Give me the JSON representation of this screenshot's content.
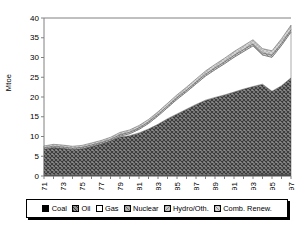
{
  "chart_data": {
    "type": "area",
    "title": "",
    "subtitle": "",
    "xlabel": "",
    "ylabel": "Mtoe",
    "ylim": [
      0,
      40
    ],
    "yticks": [
      0,
      5,
      10,
      15,
      20,
      25,
      30,
      35,
      40
    ],
    "grid": false,
    "legend_position": "bottom",
    "stacked": true,
    "x": [
      1971,
      1972,
      1973,
      1974,
      1975,
      1976,
      1977,
      1978,
      1979,
      1980,
      1981,
      1982,
      1983,
      1984,
      1985,
      1986,
      1987,
      1988,
      1989,
      1990,
      1991,
      1992,
      1993,
      1994,
      1995,
      1996,
      1997
    ],
    "xtick_labels": [
      "1971",
      "1973",
      "1975",
      "1977",
      "1979",
      "1981",
      "1983",
      "1985",
      "1987",
      "1989",
      "1991",
      "1993",
      "1995",
      "1997"
    ],
    "series": [
      {
        "name": "Coal",
        "values": [
          0.3,
          0.3,
          0.3,
          0.3,
          0.3,
          0.3,
          0.3,
          0.3,
          0.3,
          0.3,
          0.3,
          0.3,
          0.3,
          0.3,
          0.3,
          0.3,
          0.3,
          0.3,
          0.3,
          0.32,
          0.35,
          0.4,
          0.45,
          0.45,
          0.45,
          0.45,
          0.45
        ]
      },
      {
        "name": "Oil",
        "values": [
          6.5,
          6.9,
          6.7,
          6.4,
          6.6,
          7.2,
          7.8,
          8.6,
          9.6,
          9.9,
          10.6,
          11.6,
          12.8,
          14.2,
          15.4,
          16.6,
          17.8,
          18.9,
          19.6,
          20.2,
          20.9,
          21.6,
          22.2,
          22.8,
          21.0,
          22.4,
          24.4
        ]
      },
      {
        "name": "Gas",
        "values": [
          0.0,
          0.0,
          0.0,
          0.0,
          0.0,
          0.0,
          0.0,
          0.0,
          0.2,
          0.5,
          0.9,
          1.4,
          2.1,
          2.8,
          3.7,
          4.4,
          5.2,
          6.1,
          7.0,
          7.9,
          8.8,
          9.5,
          10.3,
          7.4,
          8.6,
          10.2,
          11.6
        ]
      },
      {
        "name": "Nuclear",
        "values": [
          0.0,
          0.0,
          0.0,
          0.0,
          0.0,
          0.0,
          0.0,
          0.0,
          0.0,
          0.0,
          0.0,
          0.0,
          0.0,
          0.0,
          0.0,
          0.0,
          0.0,
          0.0,
          0.0,
          0.0,
          0.0,
          0.0,
          0.0,
          0.0,
          0.0,
          0.0,
          0.0
        ]
      },
      {
        "name": "Hydro/Oth.",
        "values": [
          0.35,
          0.36,
          0.36,
          0.36,
          0.37,
          0.38,
          0.38,
          0.39,
          0.4,
          0.4,
          0.41,
          0.42,
          0.43,
          0.44,
          0.45,
          0.46,
          0.47,
          0.48,
          0.49,
          0.5,
          0.51,
          0.52,
          0.53,
          0.54,
          0.55,
          0.56,
          0.57
        ]
      },
      {
        "name": "Comb. Renew.",
        "values": [
          0.45,
          0.46,
          0.46,
          0.47,
          0.48,
          0.49,
          0.5,
          0.52,
          0.54,
          0.56,
          0.58,
          0.6,
          0.63,
          0.66,
          0.7,
          0.74,
          0.78,
          0.82,
          0.86,
          0.9,
          0.94,
          0.98,
          1.02,
          1.06,
          1.1,
          1.14,
          1.18
        ]
      }
    ],
    "totals": [
      7.6,
      8.02,
      7.82,
      7.53,
      7.75,
      8.37,
      8.98,
      9.81,
      11.04,
      11.66,
      12.79,
      14.32,
      16.26,
      18.4,
      20.55,
      22.5,
      24.55,
      26.6,
      28.25,
      29.82,
      31.5,
      33.0,
      34.5,
      32.25,
      31.7,
      34.75,
      38.2
    ]
  },
  "legend": {
    "items": [
      {
        "label": "Coal",
        "swatch": "solid-black"
      },
      {
        "label": "Oil",
        "swatch": "dark-crosshatch"
      },
      {
        "label": "Gas",
        "swatch": "white"
      },
      {
        "label": "Nuclear",
        "swatch": "mid-gray-hatch"
      },
      {
        "label": "Hydro/Oth.",
        "swatch": "light-gray-hatch"
      },
      {
        "label": "Comb. Renew.",
        "swatch": "light-gray-dots"
      }
    ]
  },
  "colors": {
    "coal": "#000000",
    "oil": "#6e6e6e",
    "gas": "#ffffff",
    "nuclear": "#a8a8a8",
    "hydro": "#bdbdbd",
    "renew": "#d0d0d0",
    "axis": "#808080",
    "text": "#000000"
  }
}
